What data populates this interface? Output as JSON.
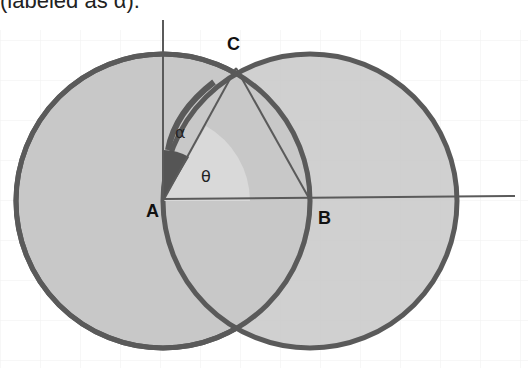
{
  "caption": "(labeled as α).",
  "diagram": {
    "points": {
      "A": {
        "label": "A",
        "x": 163,
        "y": 201
      },
      "B": {
        "label": "B",
        "x": 310,
        "y": 201
      },
      "C": {
        "label": "C",
        "x": 236,
        "y": 68
      }
    },
    "circles": [
      {
        "name": "circle-A",
        "cx": 163,
        "cy": 201,
        "r": 147
      },
      {
        "name": "circle-B",
        "cx": 310,
        "cy": 201,
        "r": 147
      }
    ],
    "angles": {
      "alpha": {
        "label": "α"
      },
      "theta": {
        "label": "θ"
      }
    },
    "colors": {
      "fill": "#c8c8c8",
      "stroke": "#5a5a5a",
      "alpha_wedge": "#555555",
      "theta_wedge": "#d9d9d9",
      "background": "#ffffff",
      "grid": "#eeeeee"
    }
  }
}
